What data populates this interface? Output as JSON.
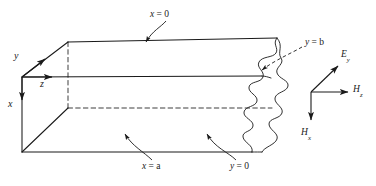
{
  "figure": {
    "type": "rectangular-waveguide-oblique-projection",
    "line_color": "#1a1a1a",
    "background": "#ffffff"
  },
  "axes": {
    "origin_label": "origin-corner",
    "items": [
      {
        "name": "y",
        "text": "y",
        "direction": "up-right",
        "x": 14,
        "y": 56
      },
      {
        "name": "z",
        "text": "z",
        "direction": "right",
        "x": 40,
        "y": 84
      },
      {
        "name": "x",
        "text": "x",
        "direction": "down",
        "x": 8,
        "y": 104
      }
    ]
  },
  "wall_labels": [
    {
      "name": "x-equals-0",
      "var": "x",
      "rel": " = 0",
      "x": 150,
      "y": 10,
      "points_to": "top-wall"
    },
    {
      "name": "y-equals-b",
      "var": "y",
      "rel": " = b",
      "x": 305,
      "y": 43,
      "points_to": "far-side-wall"
    },
    {
      "name": "x-equals-a",
      "var": "x",
      "rel": " = a",
      "x": 142,
      "y": 167,
      "points_to": "bottom-wall"
    },
    {
      "name": "y-equals-0",
      "var": "y",
      "rel": " = 0",
      "x": 230,
      "y": 167,
      "points_to": "near-side-wall"
    }
  ],
  "field_triad": {
    "name": "field-vector-triad",
    "vectors": [
      {
        "name": "E-y",
        "symbol": "E",
        "sub": "y",
        "direction": "up-right",
        "x": 341,
        "y": 55
      },
      {
        "name": "H-z",
        "symbol": "H",
        "sub": "z",
        "direction": "right",
        "x": 353,
        "y": 84
      },
      {
        "name": "H-x",
        "symbol": "H",
        "sub": "x",
        "direction": "down",
        "x": 300,
        "y": 128
      }
    ]
  }
}
